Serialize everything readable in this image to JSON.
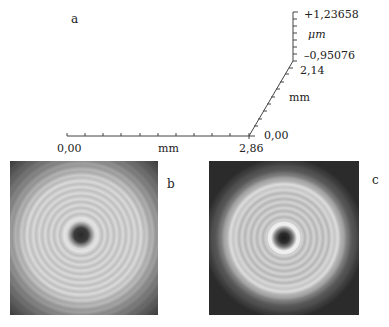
{
  "panels": {
    "a": {
      "label": "a"
    },
    "b": {
      "label": "b"
    },
    "c": {
      "label": "c"
    }
  },
  "axes": {
    "x": {
      "min": "0,00",
      "max": "2,86",
      "unit": "mm"
    },
    "y": {
      "min": "0,00",
      "max": "2,14",
      "unit": "mm"
    },
    "z": {
      "max": "+1,23658",
      "min": "–0,95076",
      "unit": "μm"
    }
  }
}
